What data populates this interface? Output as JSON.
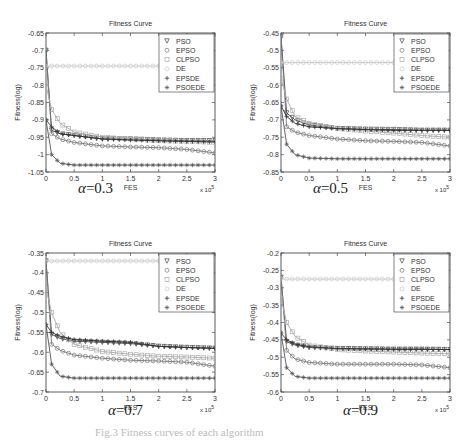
{
  "figure": {
    "caption": "Fig.3  Fitness curves of each algorithm",
    "panels": [
      {
        "alpha_label": "α",
        "alpha_value": "=0.3"
      },
      {
        "alpha_label": "α",
        "alpha_value": "=0.5"
      },
      {
        "alpha_label": "α",
        "alpha_value": "=0.7"
      },
      {
        "alpha_label": "α",
        "alpha_value": "=0.9"
      }
    ]
  },
  "chart_data": [
    {
      "type": "line",
      "title": "Fitness Curve",
      "xlabel": "FES",
      "ylabel": "Fitness(log)",
      "x_multiplier": "x 10^5",
      "xlim": [
        0,
        3
      ],
      "ylim": [
        -1.05,
        -0.65
      ],
      "xticks": [
        "0",
        "0.5",
        "1",
        "1.5",
        "2",
        "2.5",
        "3"
      ],
      "yticks": [
        "-0.65",
        "-0.7",
        "-0.75",
        "-0.8",
        "-0.85",
        "-0.9",
        "-0.95",
        "-1",
        "-1.05"
      ],
      "legend": [
        "PSO",
        "EPSO",
        "CLPSO",
        "DE",
        "EPSDE",
        "PSOEDE"
      ],
      "legend_position": "upper right",
      "x": [
        0,
        0.1,
        0.25,
        0.5,
        1,
        1.5,
        2,
        2.5,
        3
      ],
      "series": [
        {
          "name": "PSO",
          "values": [
            -0.7,
            -0.93,
            -0.94,
            -0.945,
            -0.955,
            -0.955,
            -0.958,
            -0.96,
            -0.96
          ]
        },
        {
          "name": "EPSO",
          "values": [
            -0.7,
            -0.94,
            -0.955,
            -0.965,
            -0.975,
            -0.978,
            -0.98,
            -0.985,
            -0.995
          ]
        },
        {
          "name": "CLPSO",
          "values": [
            -0.8,
            -0.87,
            -0.91,
            -0.935,
            -0.95,
            -0.955,
            -0.96,
            -0.962,
            -0.965
          ]
        },
        {
          "name": "DE",
          "values": [
            -0.745,
            -0.745,
            -0.745,
            -0.745,
            -0.745,
            -0.745,
            -0.745,
            -0.745,
            -0.745
          ]
        },
        {
          "name": "EPSDE",
          "values": [
            -0.9,
            -0.92,
            -0.94,
            -0.945,
            -0.955,
            -0.958,
            -0.96,
            -0.962,
            -0.963
          ]
        },
        {
          "name": "PSOEDE",
          "values": [
            -0.9,
            -1.0,
            -1.025,
            -1.03,
            -1.03,
            -1.03,
            -1.03,
            -1.03,
            -1.03
          ]
        }
      ],
      "annotation": "α=0.3"
    },
    {
      "type": "line",
      "title": "Fitness Curve",
      "xlabel": "FES",
      "ylabel": "Fitness(log)",
      "x_multiplier": "x 10^5",
      "xlim": [
        0,
        3
      ],
      "ylim": [
        -0.85,
        -0.45
      ],
      "xticks": [
        "0",
        "0.5",
        "1",
        "1.5",
        "2",
        "2.5",
        "3"
      ],
      "yticks": [
        "-0.45",
        "-0.5",
        "-0.55",
        "-0.6",
        "-0.65",
        "-0.7",
        "-0.75",
        "-0.8",
        "-0.85"
      ],
      "legend": [
        "PSO",
        "EPSO",
        "CLPSO",
        "DE",
        "EPSDE",
        "PSOEDE"
      ],
      "legend_position": "upper right",
      "x": [
        0,
        0.1,
        0.25,
        0.5,
        1,
        1.5,
        2,
        2.5,
        3
      ],
      "series": [
        {
          "name": "PSO",
          "values": [
            -0.46,
            -0.68,
            -0.7,
            -0.715,
            -0.725,
            -0.727,
            -0.728,
            -0.73,
            -0.73
          ]
        },
        {
          "name": "EPSO",
          "values": [
            -0.46,
            -0.72,
            -0.735,
            -0.745,
            -0.755,
            -0.76,
            -0.762,
            -0.765,
            -0.775
          ]
        },
        {
          "name": "CLPSO",
          "values": [
            -0.58,
            -0.64,
            -0.69,
            -0.71,
            -0.725,
            -0.732,
            -0.738,
            -0.745,
            -0.75
          ]
        },
        {
          "name": "DE",
          "values": [
            -0.535,
            -0.535,
            -0.535,
            -0.535,
            -0.535,
            -0.535,
            -0.535,
            -0.535,
            -0.535
          ]
        },
        {
          "name": "EPSDE",
          "values": [
            -0.66,
            -0.69,
            -0.71,
            -0.72,
            -0.725,
            -0.728,
            -0.73,
            -0.73,
            -0.73
          ]
        },
        {
          "name": "PSOEDE",
          "values": [
            -0.66,
            -0.77,
            -0.8,
            -0.81,
            -0.812,
            -0.812,
            -0.812,
            -0.812,
            -0.812
          ]
        }
      ],
      "annotation": "α=0.5"
    },
    {
      "type": "line",
      "title": "Fitness Curve",
      "xlabel": "FES",
      "ylabel": "Fitness(log)",
      "x_multiplier": "x 10^5",
      "xlim": [
        0,
        3
      ],
      "ylim": [
        -0.7,
        -0.35
      ],
      "xticks": [
        "0",
        "0.5",
        "1",
        "1.5",
        "2",
        "2.5",
        "3"
      ],
      "yticks": [
        "-0.35",
        "-0.4",
        "-0.45",
        "-0.5",
        "-0.55",
        "-0.6",
        "-0.65",
        "-0.7"
      ],
      "legend": [
        "PSO",
        "EPSO",
        "CLPSO",
        "DE",
        "EPSDE",
        "PSOEDE"
      ],
      "legend_position": "upper right",
      "x": [
        0,
        0.1,
        0.25,
        0.5,
        1,
        1.5,
        2,
        2.5,
        3
      ],
      "series": [
        {
          "name": "PSO",
          "values": [
            -0.37,
            -0.555,
            -0.565,
            -0.572,
            -0.575,
            -0.578,
            -0.585,
            -0.588,
            -0.59
          ]
        },
        {
          "name": "EPSO",
          "values": [
            -0.37,
            -0.58,
            -0.595,
            -0.607,
            -0.615,
            -0.62,
            -0.622,
            -0.625,
            -0.635
          ]
        },
        {
          "name": "CLPSO",
          "values": [
            -0.44,
            -0.5,
            -0.55,
            -0.58,
            -0.598,
            -0.605,
            -0.61,
            -0.612,
            -0.615
          ]
        },
        {
          "name": "DE",
          "values": [
            -0.37,
            -0.37,
            -0.37,
            -0.37,
            -0.37,
            -0.37,
            -0.37,
            -0.37,
            -0.37
          ]
        },
        {
          "name": "EPSDE",
          "values": [
            -0.53,
            -0.55,
            -0.56,
            -0.568,
            -0.572,
            -0.575,
            -0.585,
            -0.588,
            -0.59
          ]
        },
        {
          "name": "PSOEDE",
          "values": [
            -0.53,
            -0.63,
            -0.66,
            -0.665,
            -0.665,
            -0.665,
            -0.665,
            -0.665,
            -0.665
          ]
        }
      ],
      "annotation": "α=0.7"
    },
    {
      "type": "line",
      "title": "Fitness Curve",
      "xlabel": "FES",
      "ylabel": "Fitness(log)",
      "x_multiplier": "x 10^5",
      "xlim": [
        0,
        3
      ],
      "ylim": [
        -0.6,
        -0.2
      ],
      "xticks": [
        "0",
        "0.5",
        "1",
        "1.5",
        "2",
        "2.5",
        "3"
      ],
      "yticks": [
        "-0.2",
        "-0.25",
        "-0.3",
        "-0.35",
        "-0.4",
        "-0.45",
        "-0.5",
        "-0.55",
        "-0.6"
      ],
      "legend": [
        "PSO",
        "EPSO",
        "CLPSO",
        "DE",
        "EPSDE",
        "PSOEDE"
      ],
      "legend_position": "upper right",
      "x": [
        0,
        0.1,
        0.25,
        0.5,
        1,
        1.5,
        2,
        2.5,
        3
      ],
      "series": [
        {
          "name": "PSO",
          "values": [
            -0.27,
            -0.455,
            -0.465,
            -0.472,
            -0.475,
            -0.476,
            -0.477,
            -0.477,
            -0.478
          ]
        },
        {
          "name": "EPSO",
          "values": [
            -0.27,
            -0.48,
            -0.505,
            -0.515,
            -0.52,
            -0.52,
            -0.52,
            -0.522,
            -0.53
          ]
        },
        {
          "name": "CLPSO",
          "values": [
            -0.33,
            -0.4,
            -0.44,
            -0.465,
            -0.478,
            -0.482,
            -0.485,
            -0.488,
            -0.49
          ]
        },
        {
          "name": "DE",
          "values": [
            -0.275,
            -0.275,
            -0.275,
            -0.275,
            -0.275,
            -0.275,
            -0.275,
            -0.275,
            -0.275
          ]
        },
        {
          "name": "EPSDE",
          "values": [
            -0.43,
            -0.45,
            -0.462,
            -0.47,
            -0.475,
            -0.476,
            -0.477,
            -0.477,
            -0.478
          ]
        },
        {
          "name": "PSOEDE",
          "values": [
            -0.43,
            -0.53,
            -0.555,
            -0.56,
            -0.56,
            -0.56,
            -0.56,
            -0.56,
            -0.56
          ]
        }
      ],
      "annotation": "α=0.9"
    }
  ]
}
